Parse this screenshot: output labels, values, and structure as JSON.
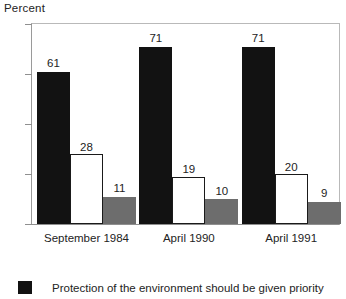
{
  "chart_data": {
    "type": "bar",
    "title": "Percent",
    "xlabel": "",
    "ylabel": "Percent",
    "ylim": [
      0,
      80
    ],
    "yticks": [
      0,
      20,
      40,
      60,
      80
    ],
    "ytick_labels": [
      "0",
      "20",
      "40",
      "60",
      "80"
    ],
    "grid": false,
    "legend_position": "bottom-left",
    "categories": [
      "September 1984",
      "April 1990",
      "April 1991"
    ],
    "series": [
      {
        "name": "Protection of the environment should be given priority",
        "color": "#121212",
        "style": "filled-black",
        "values": [
          61,
          71,
          71
        ],
        "value_labels": [
          "61",
          "71",
          "71"
        ]
      },
      {
        "name": "Economic growth should be given priority",
        "color": "#ffffff",
        "style": "outlined-white",
        "values": [
          28,
          19,
          20
        ],
        "value_labels": [
          "28",
          "19",
          "20"
        ]
      },
      {
        "name": "Don't know / No opinion",
        "color": "#6d6d6d",
        "style": "filled-gray",
        "values": [
          11,
          10,
          9
        ],
        "value_labels": [
          "11",
          "10",
          "9"
        ]
      }
    ]
  },
  "legend": {
    "entries": [
      {
        "swatch": "black",
        "label": "Protection of the environment should be given priority"
      }
    ]
  },
  "colors": {
    "series_black": "#121212",
    "series_white": "#ffffff",
    "series_gray": "#6d6d6d",
    "axis": "#8f8f8f",
    "frame": "#b9b9b9",
    "text": "#232323",
    "background": "#ffffff"
  }
}
